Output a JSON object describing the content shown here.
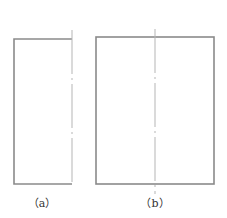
{
  "figure": {
    "panels": [
      {
        "id": "a",
        "caption": "（a）",
        "shape": "half-rectangle (open on symmetry axis)",
        "outline": {
          "left": 14,
          "top": 39,
          "right": 72,
          "bottom": 184
        },
        "center_line": {
          "x": 72,
          "y1": 30,
          "y2": 186,
          "style": "dash-dot"
        }
      },
      {
        "id": "b",
        "caption": "（b）",
        "shape": "rectangle",
        "outline": {
          "left": 96,
          "top": 37,
          "right": 214,
          "bottom": 184
        },
        "center_line": {
          "x": 155,
          "y1": 29,
          "y2": 194,
          "style": "dash-dot"
        }
      }
    ],
    "colors": {
      "outline": "#8a8a8a",
      "center_line": "#b5b5b5",
      "caption": "#333333"
    }
  }
}
